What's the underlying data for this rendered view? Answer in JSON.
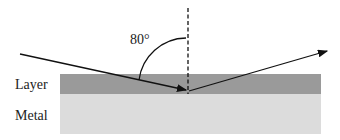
{
  "diagram": {
    "angle_label": "80°",
    "layer_label": "Layer",
    "metal_label": "Metal",
    "colors": {
      "layer": "#9a9a9a",
      "metal": "#dcdcdc",
      "line": "#111111"
    }
  }
}
